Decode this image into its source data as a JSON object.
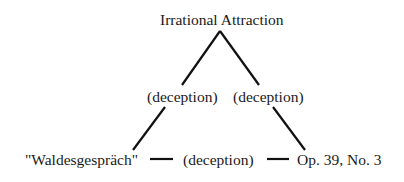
{
  "diagram": {
    "nodes": {
      "top": {
        "label": "Irrational Attraction"
      },
      "left": {
        "label": "\"Waldesgespräch\""
      },
      "right": {
        "label": "Op. 39, No. 3"
      }
    },
    "edges": {
      "top_left": {
        "label": "(deception)"
      },
      "top_right": {
        "label": "(deception)"
      },
      "left_right": {
        "label": "(deception)"
      }
    },
    "line_color": "#111111",
    "text_color": "#1a1a1a"
  }
}
